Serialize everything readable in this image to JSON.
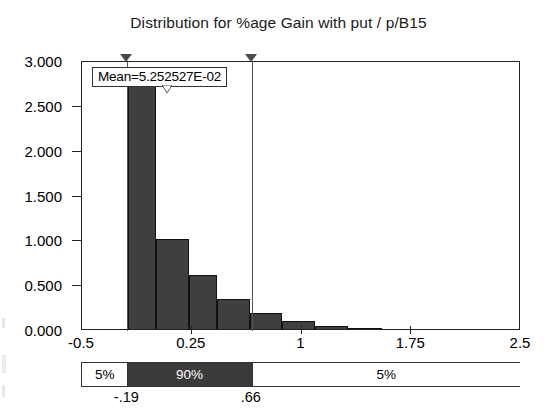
{
  "chart_data": {
    "type": "bar",
    "title": "Distribution for %age Gain with put / p/B15",
    "xlabel": "",
    "ylabel": "",
    "xlim": [
      -0.5,
      2.5
    ],
    "ylim": [
      0.0,
      3.0
    ],
    "grid": false,
    "legend_position": "none",
    "x_tick_labels": [
      "-0.5",
      "0.25",
      "1",
      "1.75",
      "2.5"
    ],
    "x_tick_values": [
      -0.5,
      0.25,
      1,
      1.75,
      2.5
    ],
    "y_tick_labels": [
      "0.000",
      "0.500",
      "1.000",
      "1.500",
      "2.000",
      "2.500",
      "3.000"
    ],
    "y_tick_values": [
      0.0,
      0.5,
      1.0,
      1.5,
      2.0,
      2.5,
      3.0
    ],
    "bin_edges": [
      -0.19,
      0.0,
      0.22,
      0.4,
      0.58,
      0.76,
      0.94,
      1.12,
      1.3,
      1.48
    ],
    "bars": [
      {
        "x0": -0.185,
        "x1": 0.005,
        "height": 2.75
      },
      {
        "x0": 0.005,
        "x1": 0.23,
        "height": 1.0
      },
      {
        "x0": 0.23,
        "x1": 0.42,
        "height": 0.6
      },
      {
        "x0": 0.42,
        "x1": 0.65,
        "height": 0.33
      },
      {
        "x0": 0.65,
        "x1": 0.87,
        "height": 0.175
      },
      {
        "x0": 0.87,
        "x1": 1.09,
        "height": 0.085
      },
      {
        "x0": 1.09,
        "x1": 1.32,
        "height": 0.03
      },
      {
        "x0": 1.32,
        "x1": 1.55,
        "height": 0.012
      }
    ],
    "annotations": [
      {
        "name": "mean-label",
        "text": "Mean=5.252527E-02",
        "value": 0.05252527
      }
    ],
    "markers": [
      {
        "name": "lower-delimiter",
        "value": -0.19,
        "label": "-.19"
      },
      {
        "name": "upper-delimiter",
        "value": 0.66,
        "label": ".66"
      }
    ],
    "percentile_bar": {
      "segments": [
        {
          "label": "5%",
          "from": -0.5,
          "to": -0.19,
          "style": "light"
        },
        {
          "label": "90%",
          "from": -0.19,
          "to": 0.66,
          "style": "dark"
        },
        {
          "label": "5%",
          "from": 0.66,
          "to": 2.5,
          "style": "light"
        }
      ],
      "boundary_labels": [
        "-.19",
        ".66"
      ]
    }
  },
  "chart": {
    "title": "Distribution for %age Gain with put / p/B15",
    "mean_label": "Mean=5.252527E-02",
    "y_labels": {
      "t0": "0.000",
      "t1": "0.500",
      "t2": "1.000",
      "t3": "1.500",
      "t4": "2.000",
      "t5": "2.500",
      "t6": "3.000"
    },
    "x_labels": {
      "t0": "-0.5",
      "t1": "0.25",
      "t2": "1",
      "t3": "1.75",
      "t4": "2.5"
    },
    "percentiles": {
      "left_pct": "5%",
      "middle_pct": "90%",
      "right_pct": "5%",
      "lower_bound": "-.19",
      "upper_bound": ".66"
    },
    "colors": {
      "bar_fill": "#3f3f3f",
      "bar_outline": "#111111",
      "axis": "#222222",
      "percentile_dark": "#3a3a3a",
      "background": "#ffffff"
    }
  }
}
